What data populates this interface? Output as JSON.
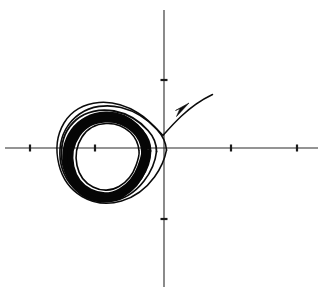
{
  "figure": {
    "title": "",
    "background_color": "#ffffff",
    "width": 325,
    "height": 294,
    "alt_text": "Phase plane portrait showing a trajectory spiralling inward onto a closed limit cycle"
  },
  "chart_data": {
    "type": "line",
    "title": "",
    "subtitle": "",
    "xlabel": "",
    "ylabel": "",
    "grid": false,
    "legend": null,
    "axis_color": "#2b2b2b",
    "curve_color": "#0b0b0b",
    "origin_px": [
      164,
      148
    ],
    "xlim": [
      -5.0,
      5.0
    ],
    "ylim": [
      -4.6,
      4.6
    ],
    "xaxis": {
      "label": "",
      "start_px": 5,
      "end_px": 318,
      "y_px": 148,
      "tick_values": [
        -4,
        -2,
        2,
        4
      ],
      "tick_px": [
        30,
        95,
        231,
        297
      ],
      "tick_labels": [
        "",
        "",
        "",
        ""
      ]
    },
    "yaxis": {
      "label": "",
      "start_px": 10,
      "end_px": 287,
      "x_px": 164,
      "tick_values": [
        2,
        -2
      ],
      "tick_px": [
        80,
        219
      ],
      "tick_labels": [
        "",
        ""
      ]
    },
    "series": [
      {
        "name": "limit-cycle",
        "role": "attracting periodic orbit",
        "stroke_width": 9,
        "center_px": [
          112,
          148
        ],
        "radius_px": 42,
        "closed": true,
        "description": "Thick black closed orbit traced repeatedly by the trajectory"
      },
      {
        "name": "incoming-trajectory",
        "role": "solution spiralling inward onto the limit cycle",
        "stroke_width": 1.5,
        "closed": false,
        "turns": 4,
        "start_px": [
          213,
          94
        ],
        "end_px": [
          150,
          148
        ],
        "description": "Trajectory enters from the upper right, sweeps left and winds several times around the origin-side loop, converging onto the limit cycle"
      }
    ],
    "annotations": [
      {
        "name": "flow-direction-arrow",
        "type": "arrowhead",
        "position_px": [
          182,
          110
        ],
        "angle_deg": -35,
        "direction": "up-right",
        "label": ""
      }
    ]
  },
  "labels": {
    "x_axis_name": "x",
    "y_axis_name": "y",
    "note": ""
  }
}
